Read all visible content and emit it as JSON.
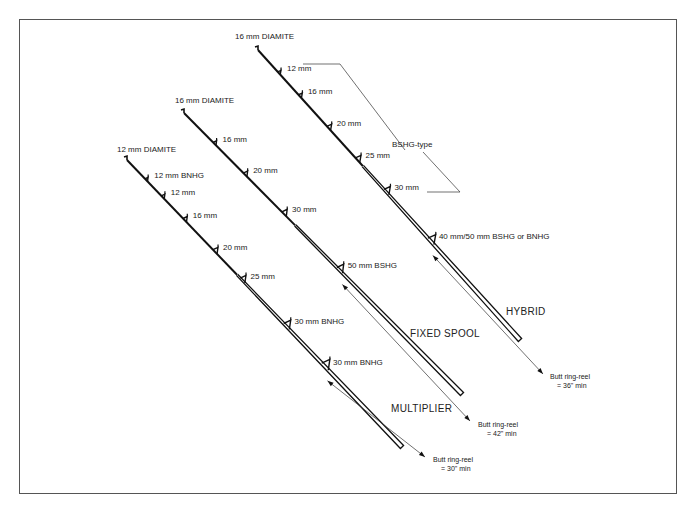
{
  "diagram": {
    "rods": [
      {
        "id": "multiplier",
        "name": "MULTIPLIER",
        "tip_label": "12 mm DIAMITE",
        "rings": [
          {
            "label": "12 mm  BNHG",
            "at": 0.07
          },
          {
            "label": "12 mm",
            "at": 0.13
          },
          {
            "label": "16 mm",
            "at": 0.21
          },
          {
            "label": "20 mm",
            "at": 0.32
          },
          {
            "label": "25 mm",
            "at": 0.42
          },
          {
            "label": "30 mm BNHG",
            "at": 0.58
          },
          {
            "label": "30 mm BNHG",
            "at": 0.72
          }
        ],
        "butt_label_1": "Butt ring-reel",
        "butt_label_2": "= 30\" min"
      },
      {
        "id": "fixed-spool",
        "name": "FIXED SPOOL",
        "tip_label": "16 mm DIAMITE",
        "rings": [
          {
            "label": "16 mm",
            "at": 0.11
          },
          {
            "label": "20 mm",
            "at": 0.22
          },
          {
            "label": "30 mm",
            "at": 0.36
          },
          {
            "label": "50 mm BSHG",
            "at": 0.56
          }
        ],
        "butt_label_1": "Butt ring-reel",
        "butt_label_2": "= 42\" min"
      },
      {
        "id": "hybrid",
        "name": "HYBRID",
        "tip_label": "16 mm DIAMITE",
        "rings": [
          {
            "label": "12 mm",
            "at": 0.08
          },
          {
            "label": "16 mm",
            "at": 0.16
          },
          {
            "label": "20 mm",
            "at": 0.27
          },
          {
            "label": "25 mm",
            "at": 0.38
          },
          {
            "label": "30 mm",
            "at": 0.49
          },
          {
            "label": "40 mm/50 mm  BSHG or BNHG",
            "at": 0.66
          }
        ],
        "butt_label_1": "Butt ring-reel",
        "butt_label_2": "= 36\" min"
      }
    ],
    "bracket_label": "BSHG-type"
  }
}
